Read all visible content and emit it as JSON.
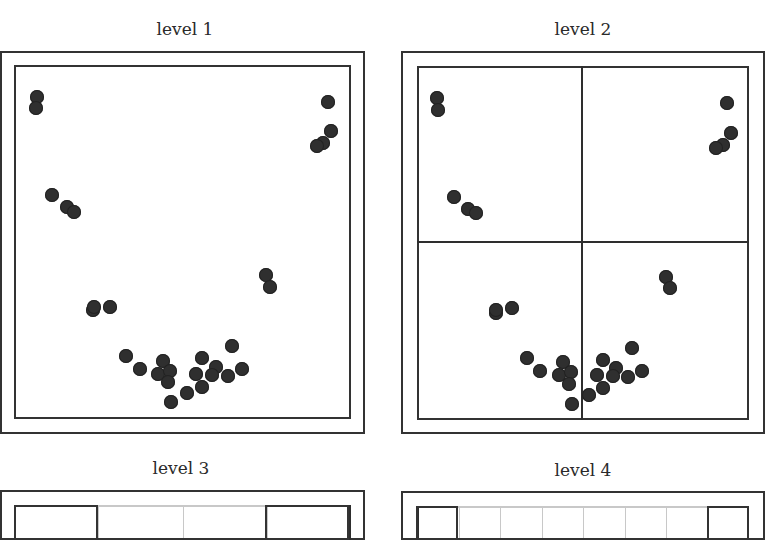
{
  "panels": [
    {
      "title": "level 1",
      "title_pos": [
        185,
        30
      ],
      "outer": [
        0,
        51,
        365,
        434
      ],
      "inner": [
        14,
        65,
        351,
        419
      ],
      "dividers": [],
      "points": [
        [
          37,
          97
        ],
        [
          36,
          108
        ],
        [
          328,
          102
        ],
        [
          331,
          131
        ],
        [
          323,
          143
        ],
        [
          317,
          146
        ],
        [
          52,
          195
        ],
        [
          67,
          207
        ],
        [
          74,
          212
        ],
        [
          266,
          275
        ],
        [
          270,
          287
        ],
        [
          93,
          310
        ],
        [
          94,
          307
        ],
        [
          110,
          307
        ],
        [
          126,
          356
        ],
        [
          140,
          369
        ],
        [
          163,
          361
        ],
        [
          158,
          374
        ],
        [
          170,
          371
        ],
        [
          168,
          382
        ],
        [
          171,
          402
        ],
        [
          187,
          393
        ],
        [
          202,
          358
        ],
        [
          196,
          374
        ],
        [
          202,
          387
        ],
        [
          216,
          367
        ],
        [
          212,
          375
        ],
        [
          228,
          376
        ],
        [
          232,
          346
        ],
        [
          242,
          369
        ]
      ]
    },
    {
      "title": "level 2",
      "title_pos": [
        583,
        30
      ],
      "outer": [
        401,
        51,
        765,
        434
      ],
      "inner": [
        417,
        66,
        749,
        420
      ],
      "dividers": [
        {
          "type": "v",
          "x": 582,
          "y1": 66,
          "y2": 420
        },
        {
          "type": "h",
          "y": 242,
          "x1": 417,
          "x2": 749
        }
      ],
      "points": [
        [
          437,
          98
        ],
        [
          438,
          110
        ],
        [
          727,
          103
        ],
        [
          731,
          133
        ],
        [
          723,
          145
        ],
        [
          716,
          148
        ],
        [
          454,
          197
        ],
        [
          468,
          209
        ],
        [
          476,
          213
        ],
        [
          666,
          277
        ],
        [
          670,
          288
        ],
        [
          496,
          313
        ],
        [
          496,
          310
        ],
        [
          512,
          308
        ],
        [
          527,
          358
        ],
        [
          540,
          371
        ],
        [
          563,
          362
        ],
        [
          559,
          375
        ],
        [
          571,
          372
        ],
        [
          569,
          384
        ],
        [
          572,
          404
        ],
        [
          589,
          395
        ],
        [
          603,
          360
        ],
        [
          597,
          375
        ],
        [
          603,
          388
        ],
        [
          616,
          368
        ],
        [
          613,
          376
        ],
        [
          628,
          377
        ],
        [
          632,
          348
        ],
        [
          642,
          371
        ]
      ]
    },
    {
      "title": "level 3",
      "title_pos": [
        181,
        469
      ],
      "outer": [
        0,
        490,
        365,
        540
      ],
      "inner": [
        14,
        505,
        351,
        540
      ],
      "grid_cols": 4,
      "highlight_cells": [
        [
          14,
          505,
          98,
          540
        ],
        [
          265,
          505,
          349,
          540
        ]
      ],
      "points": []
    },
    {
      "title": "level 4",
      "title_pos": [
        583,
        471
      ],
      "outer": [
        401,
        491,
        765,
        540
      ],
      "inner": [
        417,
        506,
        749,
        540
      ],
      "grid_cols": 8,
      "highlight_cells": [
        [
          416,
          506,
          458,
          540
        ],
        [
          707,
          506,
          749,
          540
        ]
      ],
      "points": []
    }
  ],
  "colors": {
    "frame": "#333333",
    "point": "#2f2f2f",
    "grid_light": "#c8c8c8",
    "text": "#2a2a2a"
  }
}
